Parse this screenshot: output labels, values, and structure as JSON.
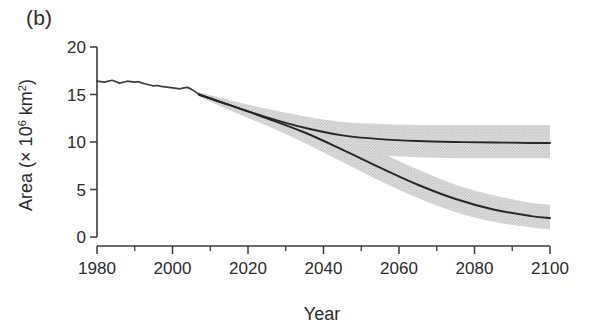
{
  "panel": {
    "label": "(b)"
  },
  "chart_data": {
    "type": "line",
    "title": "",
    "subtitle": "",
    "xlabel": "Year",
    "ylabel": "Area (× 10⁶ km²)",
    "ylabel_parts": {
      "prefix": "Area (× 10",
      "exp1": "6",
      "mid": " km",
      "exp2": "2",
      "suffix": ")"
    },
    "xlim": [
      1980,
      2100
    ],
    "ylim": [
      0,
      20
    ],
    "grid": false,
    "legend": "none",
    "x_major_ticks": [
      1980,
      2000,
      2020,
      2040,
      2060,
      2080,
      2100
    ],
    "x_minor_ticks": [
      1990,
      2010,
      2030,
      2050,
      2070,
      2090
    ],
    "x_tick_labels": [
      "1980",
      "2000",
      "2020",
      "2040",
      "2060",
      "2080",
      "2100"
    ],
    "y_major_ticks": [
      0,
      5,
      10,
      15,
      20
    ],
    "y_tick_labels": [
      "0",
      "5",
      "10",
      "15",
      "20"
    ],
    "colors": {
      "line": "#262626",
      "band": "#d2d2d2",
      "axis": "#3a3a3a",
      "background": "#ffffff"
    },
    "series": [
      {
        "name": "Historical",
        "kind": "line",
        "x": [
          1980,
          1982,
          1984,
          1986,
          1988,
          1990,
          1991,
          1992,
          1993,
          1994,
          1995,
          1996,
          1997,
          1998,
          1999,
          2000,
          2001,
          2002,
          2003,
          2004,
          2005,
          2006,
          2007
        ],
        "values": [
          16.4,
          16.3,
          16.5,
          16.2,
          16.4,
          16.3,
          16.35,
          16.2,
          16.1,
          16.0,
          15.9,
          15.95,
          15.85,
          15.8,
          15.75,
          15.7,
          15.65,
          15.6,
          15.7,
          15.75,
          15.55,
          15.3,
          15.0
        ]
      },
      {
        "name": "Projection A (stabilizing)",
        "kind": "line",
        "x": [
          2007,
          2015,
          2025,
          2035,
          2045,
          2055,
          2065,
          2075,
          2085,
          2095,
          2100
        ],
        "values": [
          15.0,
          13.9,
          12.6,
          11.5,
          10.7,
          10.3,
          10.1,
          10.0,
          9.95,
          9.9,
          9.9
        ]
      },
      {
        "name": "Projection A upper bound",
        "kind": "band_upper",
        "x": [
          2007,
          2015,
          2025,
          2035,
          2045,
          2055,
          2065,
          2075,
          2085,
          2095,
          2100
        ],
        "values": [
          15.2,
          14.4,
          13.5,
          12.7,
          12.1,
          11.9,
          11.8,
          11.8,
          11.8,
          11.8,
          11.8
        ]
      },
      {
        "name": "Projection A lower bound",
        "kind": "band_lower",
        "x": [
          2007,
          2015,
          2025,
          2035,
          2045,
          2055,
          2065,
          2075,
          2085,
          2095,
          2100
        ],
        "values": [
          14.8,
          13.4,
          11.8,
          10.4,
          9.2,
          8.6,
          8.4,
          8.3,
          8.3,
          8.3,
          8.3
        ]
      },
      {
        "name": "Projection B (declining)",
        "kind": "line",
        "x": [
          2007,
          2015,
          2025,
          2035,
          2045,
          2055,
          2065,
          2075,
          2085,
          2095,
          2100
        ],
        "values": [
          15.0,
          13.9,
          12.5,
          11.0,
          9.2,
          7.3,
          5.5,
          4.0,
          2.9,
          2.2,
          2.0
        ]
      },
      {
        "name": "Projection B upper bound",
        "kind": "band_upper",
        "x": [
          2007,
          2015,
          2025,
          2035,
          2045,
          2055,
          2065,
          2075,
          2085,
          2095,
          2100
        ],
        "values": [
          15.2,
          14.4,
          13.4,
          12.2,
          10.6,
          8.9,
          7.1,
          5.5,
          4.4,
          3.6,
          3.4
        ]
      },
      {
        "name": "Projection B lower bound",
        "kind": "band_lower",
        "x": [
          2007,
          2015,
          2025,
          2035,
          2045,
          2055,
          2065,
          2075,
          2085,
          2095,
          2100
        ],
        "values": [
          14.8,
          13.4,
          11.7,
          9.9,
          7.9,
          5.9,
          4.1,
          2.6,
          1.6,
          1.0,
          0.8
        ]
      }
    ],
    "annotations": [
      {
        "text": "Projection bands diverge after approximately 2035"
      }
    ]
  }
}
